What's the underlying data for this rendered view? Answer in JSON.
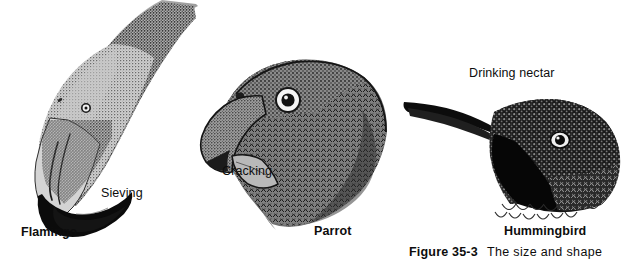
{
  "figure": {
    "caption_number": "Figure 35-3",
    "caption_text": "The size and shape",
    "background_color": "#ffffff",
    "ink_color": "#0d0d0d"
  },
  "birds": [
    {
      "species_label": "Flamingo",
      "action_label": "Sieving",
      "art_name": "flamingo-head-illustration"
    },
    {
      "species_label": "Parrot",
      "action_label": "Cracking",
      "art_name": "parrot-head-illustration"
    },
    {
      "species_label": "Hummingbird",
      "action_label": "Drinking nectar",
      "art_name": "hummingbird-head-illustration"
    }
  ],
  "label_positions": {
    "sieving": {
      "left": "101px",
      "top": "186px"
    },
    "flamingo": {
      "left": "21px",
      "top": "225px"
    },
    "cracking": {
      "left": "222px",
      "top": "164px"
    },
    "parrot": {
      "left": "314px",
      "top": "224px"
    },
    "drinking_nectar": {
      "left": "469px",
      "top": "66px"
    },
    "hummingbird": {
      "left": "504px",
      "top": "224px"
    }
  }
}
